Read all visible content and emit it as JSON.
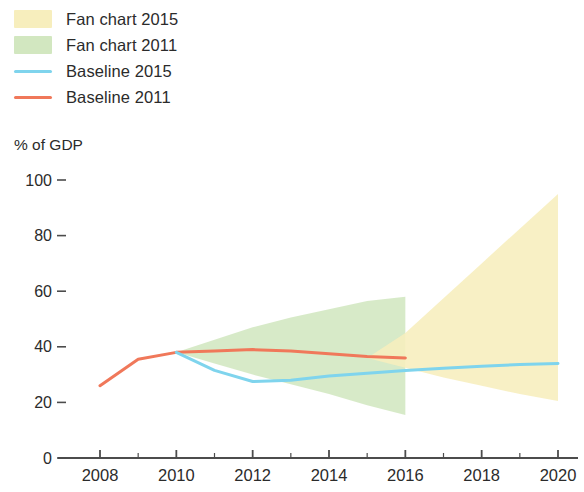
{
  "legend": {
    "items": [
      {
        "label": "Fan chart 2015",
        "type": "swatch",
        "color": "#f7eebd",
        "name": "legend-fan-2015"
      },
      {
        "label": "Fan chart 2011",
        "type": "swatch",
        "color": "#d2e7c0",
        "name": "legend-fan-2011"
      },
      {
        "label": "Baseline 2015",
        "type": "line",
        "color": "#7fd4ed",
        "name": "legend-baseline-2015"
      },
      {
        "label": "Baseline 2011",
        "type": "line",
        "color": "#f0785a",
        "name": "legend-baseline-2011"
      }
    ]
  },
  "chart_data": {
    "type": "area",
    "title": "",
    "subtitle": "",
    "xlabel": "",
    "ylabel": "% of GDP",
    "xlim": [
      2007.4,
      2020.5
    ],
    "ylim": [
      0,
      100
    ],
    "grid": false,
    "legend_position": "top-left",
    "y_ticks": [
      0,
      20,
      40,
      60,
      80,
      100
    ],
    "y_tick_labels": [
      "0",
      "20",
      "40",
      "60",
      "80",
      "100"
    ],
    "x_ticks": [
      2008,
      2009,
      2010,
      2011,
      2012,
      2013,
      2014,
      2015,
      2016,
      2017,
      2018,
      2019,
      2020
    ],
    "x_tick_labels": [
      "2008",
      "",
      "2010",
      "",
      "2012",
      "",
      "2014",
      "",
      "2016",
      "",
      "2018",
      "",
      "2020"
    ],
    "x_labeled_ticks": [
      2008,
      2010,
      2012,
      2014,
      2016,
      2018,
      2020
    ],
    "series": [
      {
        "name": "Fan chart 2011",
        "type": "band",
        "color": "#d2e7c0",
        "x": [
          2010,
          2011,
          2012,
          2013,
          2014,
          2015,
          2016
        ],
        "upper": [
          38.0,
          42.5,
          47.0,
          50.5,
          53.5,
          56.5,
          58.0
        ],
        "lower": [
          38.0,
          34.0,
          30.0,
          26.5,
          23.0,
          19.0,
          15.5
        ]
      },
      {
        "name": "Fan chart 2015",
        "type": "band",
        "color": "#f7eebd",
        "x": [
          2015,
          2016,
          2017,
          2018,
          2019,
          2020
        ],
        "upper": [
          36.0,
          45.0,
          57.5,
          70.0,
          82.5,
          95.0
        ],
        "lower": [
          36.0,
          32.5,
          29.0,
          26.0,
          23.0,
          20.5
        ]
      },
      {
        "name": "Baseline 2011",
        "type": "line",
        "color": "#f0785a",
        "x": [
          2008,
          2009,
          2010,
          2011,
          2012,
          2013,
          2014,
          2015,
          2016
        ],
        "y": [
          26.0,
          35.5,
          38.0,
          38.5,
          39.0,
          38.5,
          37.5,
          36.5,
          36.0
        ]
      },
      {
        "name": "Baseline 2015",
        "type": "line",
        "color": "#7fd4ed",
        "x": [
          2010,
          2011,
          2012,
          2013,
          2014,
          2015,
          2016,
          2017,
          2018,
          2019,
          2020
        ],
        "y": [
          38.0,
          31.5,
          27.5,
          28.0,
          29.5,
          30.5,
          31.5,
          32.3,
          33.0,
          33.6,
          34.0
        ]
      }
    ]
  },
  "axis": {
    "y_title": "% of GDP"
  }
}
